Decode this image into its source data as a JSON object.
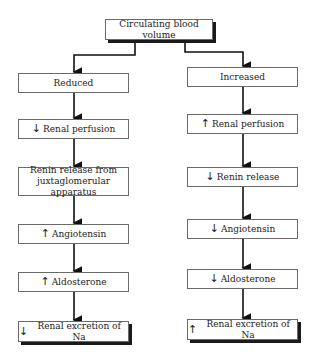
{
  "diagram": {
    "root": {
      "label": "Circulating blood volume"
    },
    "branches": [
      {
        "label": "Reduced",
        "steps": [
          {
            "direction": "down",
            "label": "Renal perfusion"
          },
          {
            "direction": "",
            "label_line1": "Renin release from",
            "label_line2": "juxtaglomerular apparatus"
          },
          {
            "direction": "up",
            "label": "Angiotensin"
          },
          {
            "direction": "up",
            "label": "Aldosterone"
          },
          {
            "direction": "down",
            "label": "Renal excretion of Na"
          }
        ]
      },
      {
        "label": "Increased",
        "steps": [
          {
            "direction": "up",
            "label": "Renal perfusion"
          },
          {
            "direction": "down",
            "label": "Renin release"
          },
          {
            "direction": "down",
            "label": "Angiotensin"
          },
          {
            "direction": "down",
            "label": "Aldosterone"
          },
          {
            "direction": "up",
            "label": "Renal excretion of Na"
          }
        ]
      }
    ],
    "icons": {
      "up": "↑",
      "down": "↓"
    }
  }
}
